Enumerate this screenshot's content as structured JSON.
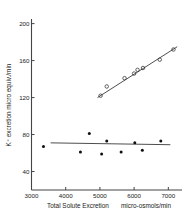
{
  "chart_data": {
    "type": "scatter",
    "title": "",
    "subtitle": "",
    "xlabel": "Total Solute Excretion",
    "xlabel_units": "micro-osmols/min",
    "ylabel": "K+ excretion micro equiv./min",
    "ylabel_display": "K⁺ excretion micro equiv./min",
    "xlim": [
      3000,
      7400
    ],
    "ylim": [
      20,
      205
    ],
    "xticks": [
      3000,
      4000,
      5000,
      6000,
      7000
    ],
    "xtick_labels": [
      "3000",
      "4000",
      "5000",
      "6000",
      "7000"
    ],
    "yticks": [
      40,
      80,
      120,
      160,
      200
    ],
    "ytick_labels": [
      "40",
      "80",
      "120",
      "160",
      "200"
    ],
    "grid": false,
    "legend": "none",
    "series": [
      {
        "name": "upper-series",
        "marker": "open-circle",
        "points": [
          {
            "x": 5020,
            "y": 122
          },
          {
            "x": 5200,
            "y": 132
          },
          {
            "x": 5720,
            "y": 141
          },
          {
            "x": 6000,
            "y": 146
          },
          {
            "x": 6100,
            "y": 150
          },
          {
            "x": 6260,
            "y": 152
          },
          {
            "x": 6750,
            "y": 161
          },
          {
            "x": 7150,
            "y": 172
          }
        ],
        "trend": {
          "x0": 4930,
          "y0": 120,
          "x1": 7260,
          "y1": 175
        }
      },
      {
        "name": "lower-series",
        "marker": "filled-circle",
        "points": [
          {
            "x": 3350,
            "y": 67
          },
          {
            "x": 4430,
            "y": 61
          },
          {
            "x": 4690,
            "y": 81
          },
          {
            "x": 5050,
            "y": 59
          },
          {
            "x": 5200,
            "y": 73
          },
          {
            "x": 5620,
            "y": 61
          },
          {
            "x": 6020,
            "y": 71
          },
          {
            "x": 6240,
            "y": 63
          },
          {
            "x": 6780,
            "y": 73
          }
        ],
        "trend": {
          "x0": 3560,
          "y0": 71,
          "x1": 7060,
          "y1": 69
        }
      }
    ]
  }
}
